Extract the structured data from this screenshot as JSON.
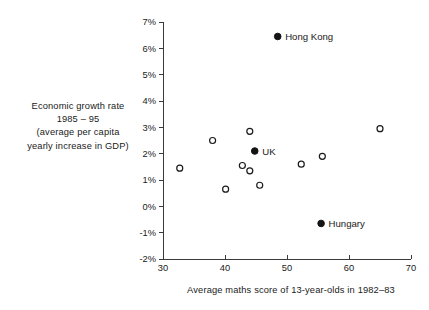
{
  "chart_data": {
    "type": "scatter",
    "title": "",
    "xlabel": "Average maths score of 13-year-olds in 1982–83",
    "ylabel_lines": [
      "Economic growth rate",
      "1985 – 95",
      "(average per capita",
      "yearly increase in GDP)"
    ],
    "ylabel": "Economic growth rate 1985 – 95 (average per capita yearly increase in GDP)",
    "xlim": [
      30,
      70
    ],
    "ylim": [
      -2,
      7
    ],
    "xticks": [
      30,
      40,
      50,
      60,
      70
    ],
    "xtick_labels": [
      "30",
      "40",
      "50",
      "60",
      "70"
    ],
    "yticks": [
      -2,
      -1,
      0,
      1,
      2,
      3,
      4,
      5,
      6,
      7
    ],
    "ytick_labels": [
      "-2%",
      "-1%",
      "0%",
      "1%",
      "2%",
      "3%",
      "4%",
      "5%",
      "6%",
      "7%"
    ],
    "grid": false,
    "legend": "none",
    "marker_styles": {
      "unlabelled": "open-circle",
      "labelled": "filled-circle"
    },
    "points": [
      {
        "x": 32.7,
        "y": 1.45,
        "label": "",
        "marker": "open-circle"
      },
      {
        "x": 38.0,
        "y": 2.5,
        "label": "",
        "marker": "open-circle"
      },
      {
        "x": 40.1,
        "y": 0.65,
        "label": "",
        "marker": "open-circle"
      },
      {
        "x": 42.8,
        "y": 1.55,
        "label": "",
        "marker": "open-circle"
      },
      {
        "x": 44.0,
        "y": 2.85,
        "label": "",
        "marker": "open-circle"
      },
      {
        "x": 44.0,
        "y": 1.35,
        "label": "",
        "marker": "open-circle"
      },
      {
        "x": 45.6,
        "y": 0.8,
        "label": "",
        "marker": "open-circle"
      },
      {
        "x": 52.3,
        "y": 1.6,
        "label": "",
        "marker": "open-circle"
      },
      {
        "x": 55.7,
        "y": 1.9,
        "label": "",
        "marker": "open-circle"
      },
      {
        "x": 65.0,
        "y": 2.95,
        "label": "",
        "marker": "open-circle"
      },
      {
        "x": 48.5,
        "y": 6.45,
        "label": "Hong Kong",
        "marker": "filled-circle"
      },
      {
        "x": 44.8,
        "y": 2.1,
        "label": "UK",
        "marker": "filled-circle"
      },
      {
        "x": 55.5,
        "y": -0.65,
        "label": "Hungary",
        "marker": "filled-circle"
      }
    ],
    "colors": {
      "axis": "#3a3a3a",
      "text": "#1a1a1a",
      "marker_fill": "#141414",
      "marker_open_fill": "#ffffff",
      "background": "#ffffff"
    }
  }
}
